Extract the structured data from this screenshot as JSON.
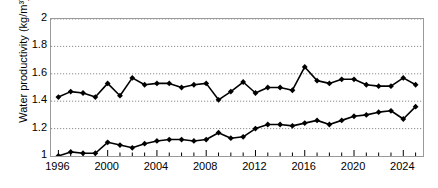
{
  "chart_data": {
    "type": "line",
    "title": "",
    "xlabel": "",
    "ylabel": "Water productivity (kg/m³)",
    "xlim": [
      1995.4,
      2025.6
    ],
    "ylim": [
      1,
      2
    ],
    "grid": true,
    "grid_style": "dotted-horizontal",
    "legend": "none",
    "marker": "filled-diamond",
    "line_color": "#000000",
    "x": [
      1996,
      1997,
      1998,
      1999,
      2000,
      2001,
      2002,
      2003,
      2004,
      2005,
      2006,
      2007,
      2008,
      2009,
      2010,
      2011,
      2012,
      2013,
      2014,
      2015,
      2016,
      2017,
      2018,
      2019,
      2020,
      2021,
      2022,
      2023,
      2024,
      2025
    ],
    "xticks": [
      1996,
      2000,
      2004,
      2008,
      2012,
      2016,
      2020,
      2024
    ],
    "yticks": [
      1,
      1.2,
      1.4,
      1.6,
      1.8,
      2
    ],
    "series": [
      {
        "name": "upper-series",
        "values": [
          1.43,
          1.47,
          1.46,
          1.43,
          1.53,
          1.44,
          1.57,
          1.52,
          1.53,
          1.53,
          1.5,
          1.52,
          1.53,
          1.41,
          1.47,
          1.54,
          1.46,
          1.5,
          1.5,
          1.48,
          1.65,
          1.55,
          1.53,
          1.56,
          1.56,
          1.52,
          1.51,
          1.51,
          1.57,
          1.52
        ]
      },
      {
        "name": "lower-series",
        "values": [
          1.0,
          1.03,
          1.02,
          1.02,
          1.1,
          1.08,
          1.06,
          1.09,
          1.11,
          1.12,
          1.12,
          1.11,
          1.12,
          1.17,
          1.13,
          1.14,
          1.2,
          1.23,
          1.23,
          1.22,
          1.24,
          1.26,
          1.23,
          1.26,
          1.29,
          1.3,
          1.32,
          1.33,
          1.27,
          1.36
        ]
      }
    ]
  }
}
